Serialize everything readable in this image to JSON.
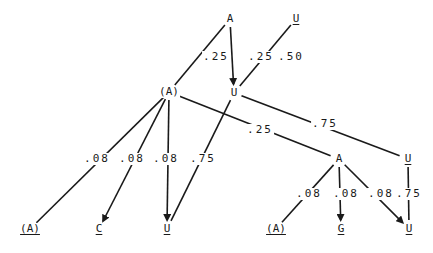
{
  "diagram": {
    "type": "probability-tree",
    "nodes": [
      {
        "id": "n_A_top",
        "label": "A",
        "underlined": false,
        "x": 230,
        "y": 19
      },
      {
        "id": "n_U_top",
        "label": "U",
        "underlined": true,
        "x": 296,
        "y": 19
      },
      {
        "id": "n_A_mid",
        "label": "(A)",
        "underlined": false,
        "x": 169,
        "y": 92
      },
      {
        "id": "n_U_mid",
        "label": "U",
        "underlined": false,
        "x": 234,
        "y": 93
      },
      {
        "id": "n_A_right",
        "label": "A",
        "underlined": false,
        "x": 339,
        "y": 159
      },
      {
        "id": "n_U_right",
        "label": "U",
        "underlined": true,
        "x": 408,
        "y": 159
      },
      {
        "id": "n_A_leaf1",
        "label": "(A)",
        "underlined": true,
        "x": 30,
        "y": 229
      },
      {
        "id": "n_C_leaf",
        "label": "C",
        "underlined": true,
        "x": 99,
        "y": 229
      },
      {
        "id": "n_U_leaf1",
        "label": "U",
        "underlined": true,
        "x": 167,
        "y": 229
      },
      {
        "id": "n_A_leaf2",
        "label": "(A)",
        "underlined": true,
        "x": 276,
        "y": 229
      },
      {
        "id": "n_G_leaf",
        "label": "G",
        "underlined": true,
        "x": 341,
        "y": 229
      },
      {
        "id": "n_U_leaf2",
        "label": "U",
        "underlined": true,
        "x": 409,
        "y": 229
      }
    ],
    "probabilities": [
      {
        "id": "p1",
        "label": ".25",
        "x": 216,
        "y": 57
      },
      {
        "id": "p2",
        "label": ".25",
        "x": 261,
        "y": 57
      },
      {
        "id": "p3",
        "label": ".50",
        "x": 291,
        "y": 57
      },
      {
        "id": "p4",
        "label": ".25",
        "x": 260,
        "y": 130
      },
      {
        "id": "p5",
        "label": ".75",
        "x": 325,
        "y": 124
      },
      {
        "id": "p6",
        "label": ".08",
        "x": 97,
        "y": 159
      },
      {
        "id": "p7",
        "label": ".08",
        "x": 132,
        "y": 159
      },
      {
        "id": "p8",
        "label": ".08",
        "x": 166,
        "y": 159
      },
      {
        "id": "p9",
        "label": ".75",
        "x": 203,
        "y": 159
      },
      {
        "id": "p10",
        "label": ".08",
        "x": 309,
        "y": 194
      },
      {
        "id": "p11",
        "label": ".08",
        "x": 346,
        "y": 194
      },
      {
        "id": "p12",
        "label": ".08",
        "x": 381,
        "y": 194
      },
      {
        "id": "p13",
        "label": ".75",
        "x": 409,
        "y": 194
      }
    ],
    "edges": [
      {
        "from": "n_A_top",
        "to": "n_A_mid",
        "prob": ".25",
        "arrow": false
      },
      {
        "from": "n_A_top",
        "to": "n_U_mid",
        "prob": ".25",
        "arrow": true
      },
      {
        "from": "n_U_top",
        "to": "n_U_mid",
        "prob": ".50",
        "arrow": false
      },
      {
        "from": "n_A_mid",
        "to": "n_A_right",
        "prob": ".25",
        "arrow": false
      },
      {
        "from": "n_U_mid",
        "to": "n_U_right",
        "prob": ".75",
        "arrow": false
      },
      {
        "from": "n_A_mid",
        "to": "n_A_leaf1",
        "prob": ".08",
        "arrow": false
      },
      {
        "from": "n_A_mid",
        "to": "n_C_leaf",
        "prob": ".08",
        "arrow": true
      },
      {
        "from": "n_A_mid",
        "to": "n_U_leaf1",
        "prob": ".08",
        "arrow": true
      },
      {
        "from": "n_U_mid",
        "to": "n_U_leaf1",
        "prob": ".75",
        "arrow": false
      },
      {
        "from": "n_A_right",
        "to": "n_A_leaf2",
        "prob": ".08",
        "arrow": false
      },
      {
        "from": "n_A_right",
        "to": "n_G_leaf",
        "prob": ".08",
        "arrow": true
      },
      {
        "from": "n_A_right",
        "to": "n_U_leaf2",
        "prob": ".08",
        "arrow": true
      },
      {
        "from": "n_U_right",
        "to": "n_U_leaf2",
        "prob": ".75",
        "arrow": false
      }
    ],
    "colors": {
      "ink": "#1a1a1a",
      "background": "#ffffff"
    }
  }
}
